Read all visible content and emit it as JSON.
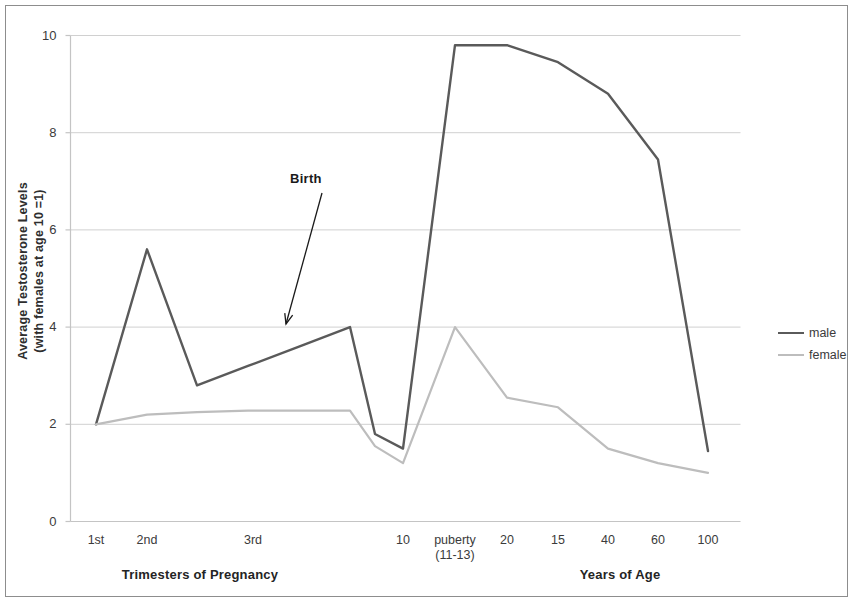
{
  "chart_data": {
    "type": "line",
    "title": "",
    "ylabel_line1": "Average Testosterone  Levels",
    "ylabel_line2": "(with females at age 10 =1)",
    "xlabel_left": "Trimesters of Pregnancy",
    "xlabel_right": "Years of Age",
    "categories": [
      "1st",
      "2nd",
      "",
      "3rd",
      "",
      "",
      "",
      "10",
      "puberty\n(11-13)",
      "20",
      "15",
      "40",
      "60",
      "100"
    ],
    "tick_labels": [
      {
        "text": "1st",
        "sub": "",
        "x": 96
      },
      {
        "text": "2nd",
        "sub": "",
        "x": 147
      },
      {
        "text": "3rd",
        "sub": "",
        "x": 253
      },
      {
        "text": "10",
        "sub": "",
        "x": 403
      },
      {
        "text": "puberty",
        "sub": "(11-13)",
        "x": 455
      },
      {
        "text": "20",
        "sub": "",
        "x": 507
      },
      {
        "text": "15",
        "sub": "",
        "x": 558
      },
      {
        "text": "40",
        "sub": "",
        "x": 608
      },
      {
        "text": "60",
        "sub": "",
        "x": 658
      },
      {
        "text": "100",
        "sub": "",
        "x": 708
      }
    ],
    "ytick_labels": [
      "0",
      "2",
      "4",
      "6",
      "8",
      "10"
    ],
    "ytick_values": [
      0,
      2,
      4,
      6,
      8,
      10
    ],
    "ylim": [
      0,
      10
    ],
    "grid": "horizontal",
    "legend_position": "right",
    "series": [
      {
        "name": "male",
        "color": "#5a5a5a",
        "width": 2.4,
        "values": [
          2.0,
          5.6,
          2.8,
          3.2,
          3.6,
          4.0,
          1.8,
          1.5,
          9.8,
          9.8,
          9.45,
          8.8,
          7.45,
          1.45
        ]
      },
      {
        "name": "female",
        "color": "#bdbdbd",
        "width": 2.2,
        "values": [
          2.0,
          2.2,
          2.25,
          2.28,
          2.28,
          2.28,
          1.55,
          1.2,
          4.0,
          2.55,
          2.35,
          1.5,
          1.2,
          1.0
        ]
      }
    ],
    "point_x": [
      96,
      147,
      197,
      248,
      299,
      350,
      375,
      403,
      455,
      507,
      558,
      608,
      658,
      708
    ],
    "annotation": {
      "text": "Birth",
      "label_x": 290,
      "label_y": 171,
      "arrow_from": [
        322,
        193
      ],
      "arrow_to": [
        286,
        324
      ]
    },
    "colors": {
      "male": "#5a5a5a",
      "female": "#bdbdbd",
      "grid": "#d0d0d0",
      "axis": "#c4c4c4",
      "text": "#3b3b3b",
      "frame": "#8d8d8d"
    }
  },
  "legend": {
    "items": [
      {
        "label": "male",
        "color": "#5a5a5a",
        "width": "2.4px"
      },
      {
        "label": "female",
        "color": "#bdbdbd",
        "width": "2.2px"
      }
    ]
  }
}
